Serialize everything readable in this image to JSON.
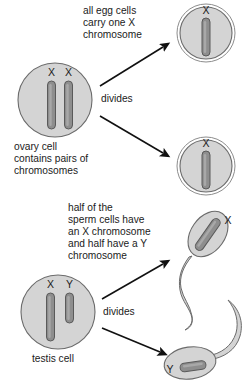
{
  "diagram": {
    "colors": {
      "cell_fill": "#d4d4d4",
      "cell_stroke": "#6b6b6b",
      "chromosome_fill": "#8e8e8e",
      "chromosome_stroke": "#5a5a5a",
      "arrow": "#111111",
      "text": "#1b1b1b",
      "background": "#ffffff"
    },
    "top_section": {
      "source_cell": {
        "name": "ovary-cell",
        "caption_line_1": "ovary cell",
        "caption_line_2": "contains pairs of",
        "caption_line_3": "chromosomes",
        "chromosomes": [
          {
            "label": "X",
            "type": "long"
          },
          {
            "label": "X",
            "type": "long"
          }
        ]
      },
      "process_label": "divides",
      "note_line_1": "all egg cells",
      "note_line_2": "carry one X",
      "note_line_3": "chromosome",
      "products": [
        {
          "name": "egg-cell-top",
          "chromosomes": [
            {
              "label": "X",
              "type": "long"
            }
          ]
        },
        {
          "name": "egg-cell-bottom",
          "chromosomes": [
            {
              "label": "X",
              "type": "long"
            }
          ]
        }
      ]
    },
    "bottom_section": {
      "source_cell": {
        "name": "testis-cell",
        "caption_line_1": "testis cell",
        "chromosomes": [
          {
            "label": "X",
            "type": "long"
          },
          {
            "label": "Y",
            "type": "short"
          }
        ]
      },
      "process_label": "divides",
      "note_line_1": "half of the",
      "note_line_2": "sperm cells have",
      "note_line_3": "an X chromosome",
      "note_line_4": "and half have a Y",
      "note_line_5": "chromosome",
      "products": [
        {
          "name": "sperm-cell-x",
          "chromosomes": [
            {
              "label": "X",
              "type": "long"
            }
          ]
        },
        {
          "name": "sperm-cell-y",
          "chromosomes": [
            {
              "label": "Y",
              "type": "short"
            }
          ]
        }
      ]
    }
  }
}
